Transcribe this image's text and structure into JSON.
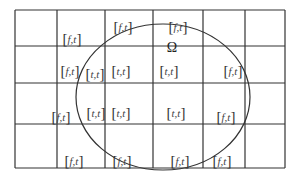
{
  "diagram": {
    "type": "grid-with-domain",
    "domain_symbol": "Ω",
    "grid": {
      "columns_x": [
        15,
        57,
        105,
        153,
        203,
        245,
        285
      ],
      "rows_y": [
        10,
        46,
        83,
        124,
        168
      ],
      "line_color": "#333333"
    },
    "domain_ellipse": {
      "cx": 163,
      "cy": 97,
      "rx": 87,
      "ry": 73
    },
    "labels": [
      {
        "text": "f,t",
        "x": 72,
        "y": 39
      },
      {
        "text": "f,t",
        "x": 123,
        "y": 27
      },
      {
        "text": "f,t",
        "x": 178,
        "y": 27
      },
      {
        "text": "f,t",
        "x": 70,
        "y": 71
      },
      {
        "text": "t,t",
        "x": 95,
        "y": 74
      },
      {
        "text": "t,t",
        "x": 121,
        "y": 71
      },
      {
        "text": "t,t",
        "x": 169,
        "y": 71
      },
      {
        "text": "f,t",
        "x": 233,
        "y": 71
      },
      {
        "text": "f,t",
        "x": 61,
        "y": 117
      },
      {
        "text": "t,t",
        "x": 96,
        "y": 113
      },
      {
        "text": "t,t",
        "x": 121,
        "y": 113
      },
      {
        "text": "t,t",
        "x": 176,
        "y": 113
      },
      {
        "text": "f,t",
        "x": 226,
        "y": 117
      },
      {
        "text": "f,t",
        "x": 74,
        "y": 161
      },
      {
        "text": "f,t",
        "x": 122,
        "y": 161
      },
      {
        "text": "f,t",
        "x": 180,
        "y": 161
      },
      {
        "text": "f,t",
        "x": 222,
        "y": 161
      }
    ],
    "omega_position": {
      "x": 172,
      "y": 48
    }
  }
}
